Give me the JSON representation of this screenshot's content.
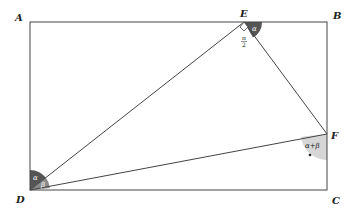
{
  "diagram": {
    "points": {
      "A": {
        "label": "A",
        "x": 30,
        "y": 22
      },
      "B": {
        "label": "B",
        "x": 327,
        "y": 22
      },
      "C": {
        "label": "C",
        "x": 327,
        "y": 190
      },
      "D": {
        "label": "D",
        "x": 30,
        "y": 190
      },
      "E": {
        "label": "E",
        "x": 244,
        "y": 22
      },
      "F": {
        "label": "F",
        "x": 327,
        "y": 134
      }
    },
    "angles": {
      "at_E_right": {
        "label": "π/2",
        "numerator": "π",
        "denominator": "2"
      },
      "at_E_alpha": {
        "label": "α"
      },
      "at_D_alpha": {
        "label": "α"
      },
      "at_D_beta": {
        "label": "β"
      },
      "at_F": {
        "label": "α+β"
      }
    },
    "colors": {
      "line": "#444444",
      "dark_fill": "#555555",
      "light_fill": "#d6d6d6",
      "mid_fill": "#8a8a8a"
    }
  }
}
